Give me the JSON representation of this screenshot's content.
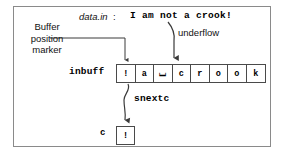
{
  "diagram": {
    "title_field": {
      "name": "data.in",
      "separator": ":",
      "value": "I am not a crook!"
    },
    "annotations": {
      "marker_label": "Buffer\nposition\nmarker",
      "underflow_label": "underflow",
      "inbuff_label": "inbuff",
      "snextc_label": "snextc",
      "c_label": "c"
    },
    "buffer": {
      "name": "inbuff",
      "cells": [
        "!",
        "a",
        "⌴",
        "c",
        "r",
        "o",
        "o",
        "k"
      ]
    },
    "char_box": {
      "name": "c",
      "value": "!"
    },
    "colors": {
      "frame_border": "#8a8a8a",
      "box_border": "#4a4a4a",
      "line": "#3a3a3a",
      "text": "#000000",
      "background": "#ffffff"
    }
  }
}
